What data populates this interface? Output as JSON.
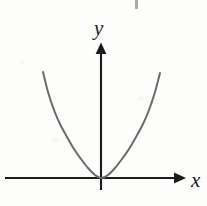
{
  "figure": {
    "background_color": "#fdfdfc",
    "axis_color": "#1b1b1b",
    "curve_color": "#6b6b6b"
  },
  "axes": {
    "x_label": "x",
    "y_label": "y",
    "origin": {
      "x": 101,
      "y": 178
    },
    "x_axis": {
      "start_x": 5,
      "end_x": 181,
      "y": 178,
      "arrow": "right"
    },
    "y_axis": {
      "x": 101,
      "start_y": 190,
      "end_y": 43,
      "arrow": "up"
    }
  },
  "chart_data": {
    "type": "line",
    "title": "",
    "xlabel": "x",
    "ylabel": "y",
    "grid": false,
    "legend": null,
    "curves": [
      {
        "name": "parabola",
        "equation": "y = a*x^2",
        "vertex": {
          "x": 0,
          "y": 0
        },
        "opens": "up",
        "color": "#6b6b6b",
        "stroke_width": 2,
        "x_pixel_left_end": 43,
        "x_pixel_right_end": 160,
        "y_pixel_top_end": 72,
        "pixel_coefficient": 0.0775,
        "points_pixel": [
          [
            43,
            72
          ],
          [
            48,
            92
          ],
          [
            54,
            110
          ],
          [
            60,
            124
          ],
          [
            67,
            137
          ],
          [
            74,
            149
          ],
          [
            81,
            159
          ],
          [
            88,
            168
          ],
          [
            95,
            175
          ],
          [
            101,
            178
          ],
          [
            108,
            175
          ],
          [
            115,
            168
          ],
          [
            122,
            159
          ],
          [
            129,
            149
          ],
          [
            136,
            137
          ],
          [
            143,
            124
          ],
          [
            149,
            110
          ],
          [
            155,
            92
          ],
          [
            160,
            73
          ]
        ]
      }
    ]
  },
  "artifacts": {
    "scan_speck": {
      "x": 135,
      "y": 0,
      "width": 3,
      "height": 9
    }
  }
}
